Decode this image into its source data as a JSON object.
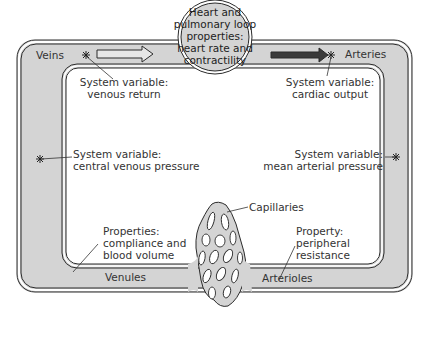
{
  "diagram": {
    "type": "circulatory-loop-schematic",
    "heart": {
      "lines": [
        "Heart and",
        "pulmonary loop",
        "properties:",
        "heart rate and",
        "contractility"
      ]
    },
    "vessels": {
      "veins": "Veins",
      "arteries": "Arteries",
      "venules": "Venules",
      "arterioles": "Arterioles",
      "capillaries": "Capillaries"
    },
    "annotations": {
      "venous_return": [
        "System variable:",
        "venous return"
      ],
      "cardiac_output": [
        "System variable:",
        "cardiac output"
      ],
      "central_venous_pressure": [
        "System variable:",
        "central venous pressure"
      ],
      "mean_arterial_pressure": [
        "System variable:",
        "mean arterial pressure"
      ],
      "compliance": [
        "Properties:",
        "compliance and",
        "blood volume"
      ],
      "peripheral_resistance": [
        "Property:",
        "peripheral",
        "resistance"
      ]
    },
    "markers": {
      "symbol": "asterisk",
      "count": 4
    },
    "flow_arrows": [
      {
        "name": "venous-flow-arrow",
        "style": "outlined",
        "direction": "right"
      },
      {
        "name": "arterial-flow-arrow",
        "style": "filled-dark",
        "direction": "right"
      }
    ],
    "colors": {
      "tube_fill": "#d4d4d4",
      "outline": "#2b2b2b",
      "background": "#ffffff",
      "arrow_dark": "#3a3a3a"
    }
  }
}
